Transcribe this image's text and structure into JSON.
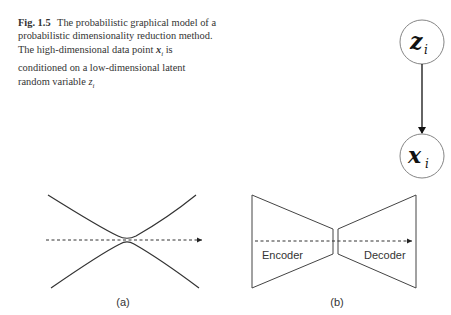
{
  "caption": {
    "label": "Fig. 1.5",
    "text_before": "The probabilistic graphical model of a probabilistic dimensionality reduction method. The high-dimensional data point",
    "var_x": "x",
    "var_x_sub": "i",
    "text_middle": "is conditioned on a low-dimensional latent random variable",
    "var_z": "z",
    "var_z_sub": "i"
  },
  "graphical_model": {
    "top_node": {
      "symbol": "z",
      "subscript": "i"
    },
    "bottom_node": {
      "symbol": "x",
      "subscript": "i"
    },
    "edge": "z_i -> x_i"
  },
  "diagram_a": {
    "label": "(a)"
  },
  "diagram_b": {
    "label": "(b)",
    "encoder_label": "Encoder",
    "decoder_label": "Decoder"
  }
}
